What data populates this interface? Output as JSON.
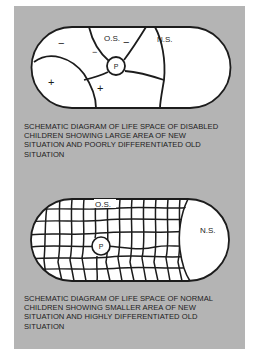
{
  "figure": {
    "background_color": "#b4b4b4",
    "region_fill": "#ffffff",
    "line_color": "#1c1c1c"
  },
  "top_diagram": {
    "labels": {
      "old_situation": "O.S.",
      "new_situation": "N.S.",
      "person": "P",
      "minus_left": "−",
      "minus_center": "−",
      "minus_right": "−",
      "plus_left": "+",
      "plus_center": "+"
    },
    "caption_lines": [
      "SCHEMATIC DIAGRAM OF LIFE SPACE  OF DISABLED",
      "CHILDREN SHOWING LARGE AREA OF NEW",
      "SITUATION  AND POORLY DIFFERENTIATED OLD",
      "SITUATION"
    ]
  },
  "bottom_diagram": {
    "labels": {
      "old_situation": "O.S.",
      "new_situation": "N.S.",
      "person": "P"
    },
    "caption_lines": [
      "SCHEMATIC DIAGRAM OF LIFE  SPACE  OF NORMAL",
      "CHILDREN SHOWING SMALLER AREA OF NEW",
      "SITUATION AND HIGHLY DIFFERENTIATED OLD",
      "SITUATION"
    ]
  }
}
